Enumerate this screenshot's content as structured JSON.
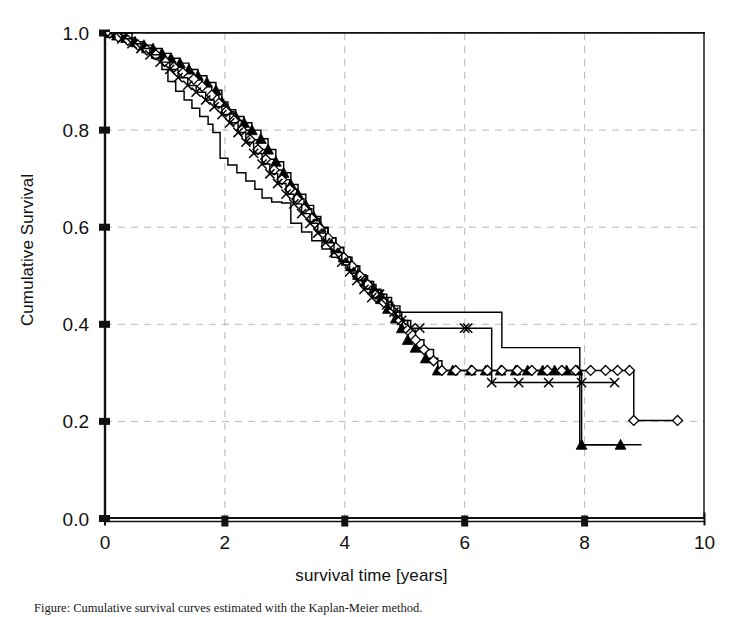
{
  "figure": {
    "width": 743,
    "height": 617,
    "background": "#ffffff",
    "line_color": "#000000",
    "grid_color": "#b9b9b9"
  },
  "axes": {
    "xlabel": "survival time [years]",
    "ylabel": "Cumulative Survival",
    "x_ticks": [
      "0",
      "2",
      "4",
      "6",
      "8",
      "10"
    ],
    "y_ticks": [
      "0.0",
      "0.2",
      "0.4",
      "0.6",
      "0.8",
      "1.0"
    ]
  },
  "caption": {
    "text": "Figure: Cumulative survival curves estimated with the Kaplan-Meier method."
  },
  "chart_data": {
    "type": "line",
    "title": "",
    "xlabel": "survival time [years]",
    "ylabel": "Cumulative Survival",
    "xlim": [
      0,
      10
    ],
    "ylim": [
      0.0,
      1.0
    ],
    "xticks": [
      0,
      2,
      4,
      6,
      8,
      10
    ],
    "yticks": [
      0.0,
      0.2,
      0.4,
      0.6,
      0.8,
      1.0
    ],
    "grid": "dashed horizontal and vertical gridlines at major ticks",
    "legend": "none",
    "curve_style": "Kaplan-Meier step functions",
    "series": [
      {
        "name": "plain-step-curve",
        "marker": "none",
        "points": [
          [
            0.0,
            1.0
          ],
          [
            0.38,
            1.0
          ],
          [
            0.45,
            0.972
          ],
          [
            0.62,
            0.96
          ],
          [
            0.78,
            0.948
          ],
          [
            0.95,
            0.925
          ],
          [
            1.05,
            0.9
          ],
          [
            1.18,
            0.88
          ],
          [
            1.32,
            0.862
          ],
          [
            1.45,
            0.845
          ],
          [
            1.58,
            0.828
          ],
          [
            1.72,
            0.812
          ],
          [
            1.8,
            0.795
          ],
          [
            1.92,
            0.742
          ],
          [
            2.05,
            0.728
          ],
          [
            2.2,
            0.712
          ],
          [
            2.35,
            0.695
          ],
          [
            2.5,
            0.678
          ],
          [
            2.62,
            0.66
          ],
          [
            2.78,
            0.652
          ],
          [
            2.95,
            0.65
          ],
          [
            3.1,
            0.608
          ],
          [
            3.28,
            0.59
          ],
          [
            3.45,
            0.572
          ],
          [
            3.62,
            0.555
          ],
          [
            3.78,
            0.538
          ],
          [
            3.95,
            0.522
          ],
          [
            4.1,
            0.505
          ],
          [
            4.28,
            0.488
          ],
          [
            4.45,
            0.47
          ],
          [
            4.62,
            0.455
          ],
          [
            4.78,
            0.438
          ],
          [
            4.92,
            0.425
          ],
          [
            6.5,
            0.425
          ],
          [
            6.62,
            0.352
          ],
          [
            7.8,
            0.352
          ],
          [
            7.92,
            0.152
          ],
          [
            8.95,
            0.152
          ]
        ]
      },
      {
        "name": "triangle-curve",
        "marker": "filled-triangle",
        "points": [
          [
            0.05,
            1.0
          ],
          [
            0.2,
            0.995
          ],
          [
            0.35,
            0.99
          ],
          [
            0.5,
            0.982
          ],
          [
            0.65,
            0.975
          ],
          [
            0.8,
            0.968
          ],
          [
            0.95,
            0.958
          ],
          [
            1.1,
            0.948
          ],
          [
            1.25,
            0.938
          ],
          [
            1.4,
            0.925
          ],
          [
            1.55,
            0.912
          ],
          [
            1.7,
            0.898
          ],
          [
            1.85,
            0.882
          ],
          [
            1.95,
            0.858
          ],
          [
            2.05,
            0.842
          ],
          [
            2.18,
            0.828
          ],
          [
            2.32,
            0.815
          ],
          [
            2.45,
            0.8
          ],
          [
            2.6,
            0.782
          ],
          [
            2.72,
            0.76
          ],
          [
            2.85,
            0.735
          ],
          [
            2.98,
            0.712
          ],
          [
            3.1,
            0.688
          ],
          [
            3.22,
            0.668
          ],
          [
            3.35,
            0.645
          ],
          [
            3.48,
            0.622
          ],
          [
            3.6,
            0.6
          ],
          [
            3.72,
            0.578
          ],
          [
            3.85,
            0.558
          ],
          [
            3.98,
            0.538
          ],
          [
            4.1,
            0.52
          ],
          [
            4.22,
            0.502
          ],
          [
            4.35,
            0.488
          ],
          [
            4.48,
            0.472
          ],
          [
            4.6,
            0.452
          ],
          [
            4.72,
            0.432
          ],
          [
            4.85,
            0.412
          ],
          [
            4.95,
            0.392
          ],
          [
            5.05,
            0.368
          ],
          [
            5.18,
            0.352
          ],
          [
            5.35,
            0.33
          ],
          [
            5.55,
            0.305
          ],
          [
            5.8,
            0.305
          ],
          [
            6.1,
            0.305
          ],
          [
            6.35,
            0.305
          ],
          [
            6.6,
            0.305
          ],
          [
            6.85,
            0.305
          ],
          [
            7.05,
            0.305
          ],
          [
            7.3,
            0.305
          ],
          [
            7.5,
            0.305
          ],
          [
            7.7,
            0.305
          ],
          [
            7.88,
            0.305
          ],
          [
            7.95,
            0.152
          ],
          [
            8.6,
            0.152
          ]
        ]
      },
      {
        "name": "diamond-curve",
        "marker": "open-diamond",
        "points": [
          [
            0.08,
            1.0
          ],
          [
            0.22,
            0.992
          ],
          [
            0.38,
            0.985
          ],
          [
            0.55,
            0.975
          ],
          [
            0.7,
            0.965
          ],
          [
            0.85,
            0.955
          ],
          [
            1.0,
            0.942
          ],
          [
            1.15,
            0.93
          ],
          [
            1.3,
            0.918
          ],
          [
            1.48,
            0.905
          ],
          [
            1.62,
            0.89
          ],
          [
            1.78,
            0.872
          ],
          [
            1.9,
            0.855
          ],
          [
            2.02,
            0.838
          ],
          [
            2.15,
            0.82
          ],
          [
            2.28,
            0.8
          ],
          [
            2.42,
            0.78
          ],
          [
            2.55,
            0.76
          ],
          [
            2.68,
            0.74
          ],
          [
            2.82,
            0.718
          ],
          [
            2.95,
            0.698
          ],
          [
            3.08,
            0.678
          ],
          [
            3.2,
            0.658
          ],
          [
            3.32,
            0.638
          ],
          [
            3.45,
            0.618
          ],
          [
            3.58,
            0.598
          ],
          [
            3.72,
            0.578
          ],
          [
            3.85,
            0.558
          ],
          [
            3.98,
            0.538
          ],
          [
            4.12,
            0.52
          ],
          [
            4.25,
            0.5
          ],
          [
            4.38,
            0.482
          ],
          [
            4.52,
            0.462
          ],
          [
            4.65,
            0.445
          ],
          [
            4.8,
            0.428
          ],
          [
            4.92,
            0.408
          ],
          [
            5.05,
            0.388
          ],
          [
            5.18,
            0.368
          ],
          [
            5.32,
            0.348
          ],
          [
            5.48,
            0.325
          ],
          [
            5.62,
            0.305
          ],
          [
            5.85,
            0.305
          ],
          [
            6.12,
            0.305
          ],
          [
            6.38,
            0.305
          ],
          [
            6.62,
            0.305
          ],
          [
            6.88,
            0.305
          ],
          [
            7.12,
            0.305
          ],
          [
            7.38,
            0.305
          ],
          [
            7.62,
            0.305
          ],
          [
            7.85,
            0.305
          ],
          [
            8.1,
            0.305
          ],
          [
            8.35,
            0.305
          ],
          [
            8.55,
            0.305
          ],
          [
            8.75,
            0.305
          ],
          [
            8.82,
            0.202
          ],
          [
            9.55,
            0.202
          ]
        ]
      },
      {
        "name": "cross-curve",
        "marker": "x-cross",
        "points": [
          [
            0.1,
            1.0
          ],
          [
            0.28,
            0.988
          ],
          [
            0.45,
            0.978
          ],
          [
            0.6,
            0.968
          ],
          [
            0.75,
            0.955
          ],
          [
            0.92,
            0.94
          ],
          [
            1.08,
            0.925
          ],
          [
            1.22,
            0.908
          ],
          [
            1.38,
            0.892
          ],
          [
            1.52,
            0.878
          ],
          [
            1.68,
            0.862
          ],
          [
            1.82,
            0.848
          ],
          [
            1.95,
            0.832
          ],
          [
            2.08,
            0.815
          ],
          [
            2.22,
            0.795
          ],
          [
            2.35,
            0.775
          ],
          [
            2.48,
            0.752
          ],
          [
            2.62,
            0.73
          ],
          [
            2.75,
            0.71
          ],
          [
            2.88,
            0.69
          ],
          [
            3.02,
            0.668
          ],
          [
            3.15,
            0.648
          ],
          [
            3.28,
            0.628
          ],
          [
            3.42,
            0.608
          ],
          [
            3.55,
            0.588
          ],
          [
            3.68,
            0.568
          ],
          [
            3.82,
            0.548
          ],
          [
            3.95,
            0.528
          ],
          [
            4.08,
            0.508
          ],
          [
            4.2,
            0.49
          ],
          [
            4.32,
            0.472
          ],
          [
            4.45,
            0.455
          ],
          [
            4.58,
            0.462
          ],
          [
            4.7,
            0.44
          ],
          [
            4.82,
            0.425
          ],
          [
            4.95,
            0.408
          ],
          [
            5.1,
            0.392
          ],
          [
            5.25,
            0.392
          ],
          [
            6.0,
            0.392
          ],
          [
            6.05,
            0.392
          ],
          [
            6.45,
            0.28
          ],
          [
            6.9,
            0.28
          ],
          [
            7.4,
            0.28
          ],
          [
            7.95,
            0.28
          ],
          [
            8.5,
            0.28
          ]
        ]
      }
    ]
  }
}
